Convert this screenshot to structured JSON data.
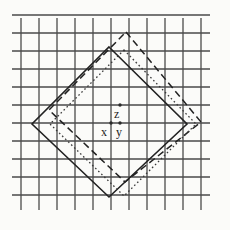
{
  "figure": {
    "background_color": "#fbfbf9",
    "ink_color": "#2a2a2a",
    "grid": {
      "line_color": "#4a4a4a",
      "line_width": 1.3,
      "spacing": 18,
      "x_start": 21,
      "y_start": 15,
      "columns": 11,
      "rows": 11,
      "tick_overhang": 6,
      "x_lines": [
        21,
        39,
        57,
        75,
        93,
        111,
        129,
        147,
        165,
        183,
        201
      ],
      "y_lines": [
        15,
        33,
        51,
        69,
        87,
        105,
        123,
        141,
        159,
        177,
        195
      ],
      "frame_left": 12,
      "frame_right": 210,
      "frame_top": 24,
      "frame_bottom": 204
    },
    "shapes": [
      {
        "name": "solid-square",
        "style": "solid",
        "stroke": "#222222",
        "stroke_width": 1.6,
        "dasharray": "",
        "vertices": [
          [
            109,
            47
          ],
          [
            187,
            124
          ],
          [
            109,
            197
          ],
          [
            32,
            124
          ]
        ]
      },
      {
        "name": "dashed-square",
        "style": "dashed",
        "stroke": "#222222",
        "stroke_width": 1.5,
        "dasharray": "7 4",
        "vertices": [
          [
            126,
            32
          ],
          [
            201,
            122
          ],
          [
            125,
            182
          ],
          [
            49,
            110
          ]
        ]
      },
      {
        "name": "dotted-square",
        "style": "dotted",
        "stroke": "#3a3a3a",
        "stroke_width": 1.3,
        "dasharray": "1.6 2.6",
        "vertices": [
          [
            124,
            50
          ],
          [
            196,
            124
          ],
          [
            124,
            196
          ],
          [
            50,
            124
          ]
        ]
      }
    ],
    "points": [
      {
        "name": "point-z",
        "label": "z",
        "cx": 120,
        "cy": 105,
        "label_x": 114,
        "label_y": 108,
        "radius": 1.7
      },
      {
        "name": "point-x",
        "label": "x",
        "cx": 111,
        "cy": 123,
        "label_x": 101,
        "label_y": 126,
        "radius": 1.7
      },
      {
        "name": "point-y",
        "label": "y",
        "cx": 120,
        "cy": 123,
        "label_x": 116,
        "label_y": 126,
        "radius": 1.7
      }
    ],
    "labels": {
      "z": "z",
      "x": "x",
      "y": "y"
    }
  }
}
